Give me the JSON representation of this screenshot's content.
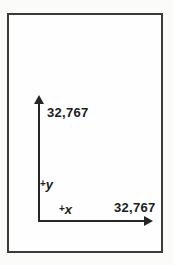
{
  "figure": {
    "name": "coordinate-plane-diagram",
    "y_axis": {
      "max_value_label": "32,767",
      "name_label": "+y",
      "plus": "+",
      "letter": "y"
    },
    "x_axis": {
      "max_value_label": "32,767",
      "name_label": "+x",
      "plus": "+",
      "letter": "x"
    },
    "colors": {
      "axis_line": "#262626",
      "frame_border": "#3b3b3b",
      "label_text": "#1c1c1c",
      "background": "#fefefe"
    }
  }
}
